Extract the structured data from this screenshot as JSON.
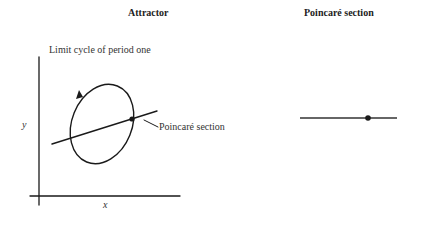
{
  "attractor_panel": {
    "title": "Attractor",
    "subtitle": "Limit cycle of period one",
    "x_axis_label": "x",
    "y_axis_label": "y",
    "annotation": "Poincaré section"
  },
  "section_panel": {
    "title": "Poincaré section"
  },
  "colors": {
    "stroke": "#1a1a1a",
    "background": "#ffffff"
  }
}
